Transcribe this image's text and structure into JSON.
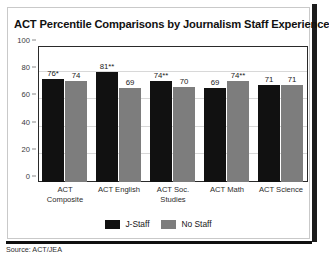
{
  "chart_data": {
    "type": "bar",
    "title": "ACT Percentile Comparisons by Journalism Staff Experience",
    "xlabel": "",
    "ylabel": "",
    "ylim": [
      0,
      100
    ],
    "yticks": [
      0,
      20,
      40,
      60,
      80,
      100
    ],
    "grid": true,
    "legend_position": "bottom",
    "categories": [
      "ACT Composite",
      "ACT English",
      "ACT Soc. Studies",
      "ACT Math",
      "ACT Science"
    ],
    "category_lines": [
      [
        "ACT",
        "Composite"
      ],
      [
        "ACT English",
        ""
      ],
      [
        "ACT Soc.",
        "Studies"
      ],
      [
        "ACT Math",
        ""
      ],
      [
        "ACT Science",
        ""
      ]
    ],
    "series": [
      {
        "name": "J-Staff",
        "color": "#111111",
        "values": [
          76,
          81,
          74,
          69,
          71
        ],
        "labels": [
          "76*",
          "81**",
          "74**",
          "69",
          "71"
        ]
      },
      {
        "name": "No Staff",
        "color": "#7d7d7d",
        "values": [
          74,
          69,
          70,
          74,
          71
        ],
        "labels": [
          "74",
          "69",
          "70",
          "74**",
          "71"
        ]
      }
    ],
    "source": "Source: ACT/JEA"
  },
  "legend": {
    "items": [
      {
        "label": "J-Staff"
      },
      {
        "label": "No Staff"
      }
    ]
  }
}
